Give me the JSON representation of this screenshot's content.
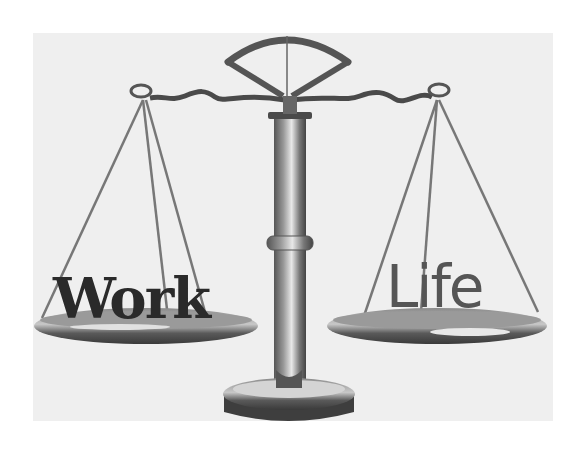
{
  "image": {
    "description": "Balance scale illustrating work-life balance",
    "left_pan_label": "Work",
    "right_pan_label": "Life"
  },
  "colors": {
    "background": "#ffffff",
    "panel": "#efefef",
    "metal_dark": "#3a3a3a",
    "metal_mid": "#7a7a7a",
    "metal_light": "#d8d8d8"
  }
}
